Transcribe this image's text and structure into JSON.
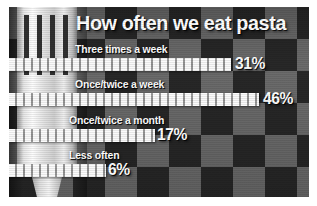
{
  "chart_data": {
    "type": "bar",
    "title": "How often we eat pasta",
    "xlabel": "",
    "ylabel": "",
    "orientation": "horizontal",
    "unit": "%",
    "categories": [
      "Three times a week",
      "Once/twice a week",
      "Once/twice a month",
      "Less often"
    ],
    "values": [
      31,
      46,
      17,
      6
    ],
    "value_labels": [
      "31%",
      "46%",
      "17%",
      "6%"
    ],
    "xlim": [
      0,
      55
    ],
    "grid": false,
    "legend": "none"
  },
  "poster": {
    "title": "How often we eat pasta",
    "rows": [
      {
        "label": "Three times a week",
        "value_label": "31%"
      },
      {
        "label": "Once/twice a week",
        "value_label": "46%"
      },
      {
        "label": "Once/twice a month",
        "value_label": "17%"
      },
      {
        "label": "Less often",
        "value_label": "6%"
      }
    ],
    "illustration": "fork-icon",
    "colors": {
      "background_dark": "#282828",
      "background_light": "#6c6c6c",
      "bar": "#d8d8d8",
      "text": "#ffffff",
      "page": "#ffffff"
    }
  }
}
